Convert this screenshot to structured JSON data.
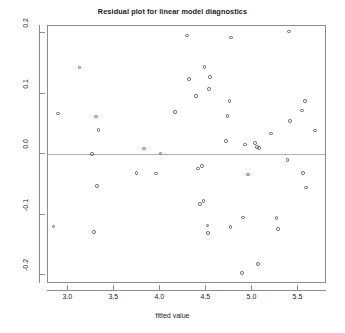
{
  "chart_data": {
    "type": "scatter",
    "title": "Residual plot for linear model diagnostics",
    "xlabel": "fitted value",
    "ylabel": "residual",
    "xlim": [
      2.78,
      5.81
    ],
    "ylim": [
      -0.215,
      0.212
    ],
    "xticks": [
      3.0,
      3.5,
      4.0,
      4.5,
      5.0,
      5.5
    ],
    "xtick_labels": [
      "3.0",
      "3.5",
      "4.0",
      "4.5",
      "5.0",
      "5.5"
    ],
    "yticks": [
      0.2,
      0.1,
      0.0,
      -0.1,
      -0.2
    ],
    "ytick_labels": [
      "0.2",
      "0.1",
      "0.0",
      "-0.1",
      "-0.2"
    ],
    "grid": false,
    "legend": null,
    "reference_line": {
      "orientation": "horizontal",
      "y": 0.0,
      "color": "#b0b0b0"
    },
    "marker": {
      "shape": "open-circle",
      "color": "#5f5f5f",
      "size": 3.6
    },
    "x": [
      2.84,
      2.89,
      3.12,
      3.26,
      3.28,
      3.3,
      3.31,
      3.33,
      3.74,
      3.82,
      3.95,
      4.0,
      4.16,
      4.29,
      4.31,
      4.39,
      4.41,
      4.43,
      4.45,
      4.47,
      4.48,
      4.51,
      4.52,
      4.53,
      4.54,
      4.71,
      4.73,
      4.75,
      4.76,
      4.77,
      4.89,
      4.9,
      4.92,
      4.95,
      5.03,
      5.05,
      5.06,
      5.07,
      5.2,
      5.26,
      5.28,
      5.38,
      5.4,
      5.41,
      5.54,
      5.55,
      5.57,
      5.58,
      5.68
    ],
    "y": [
      -0.12,
      0.067,
      0.143,
      0.0,
      -0.129,
      0.062,
      -0.053,
      0.04,
      -0.031,
      0.009,
      -0.032,
      0.001,
      0.07,
      0.196,
      0.124,
      0.096,
      -0.024,
      -0.083,
      -0.02,
      -0.078,
      0.144,
      -0.118,
      -0.131,
      0.108,
      0.128,
      0.022,
      0.063,
      0.088,
      -0.121,
      0.193,
      -0.197,
      -0.105,
      0.016,
      -0.034,
      0.018,
      0.012,
      -0.182,
      0.01,
      0.034,
      -0.106,
      -0.124,
      -0.01,
      0.203,
      0.055,
      0.072,
      -0.031,
      0.088,
      -0.055,
      0.039
    ]
  }
}
